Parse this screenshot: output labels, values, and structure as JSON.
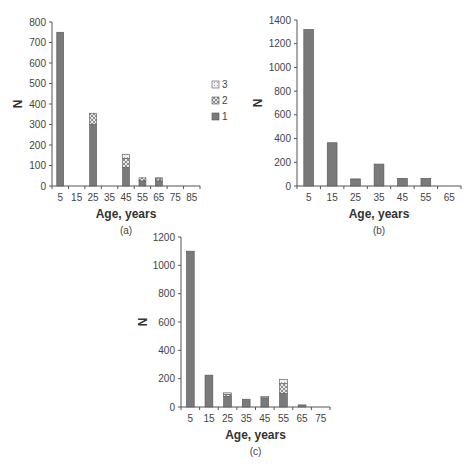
{
  "colors": {
    "series_1": "#7a7a7a",
    "series_2_pattern": "#9a9a9a",
    "series_3": "#e6e6e6",
    "axis": "#555555"
  },
  "chart_data": [
    {
      "id": "a",
      "type": "bar",
      "stacked": true,
      "caption": "(a)",
      "title": "",
      "xlabel": "Age, years",
      "ylabel": "N",
      "categories": [
        "5",
        "15",
        "25",
        "35",
        "45",
        "55",
        "65",
        "75",
        "85"
      ],
      "yticks": [
        0,
        100,
        200,
        300,
        400,
        500,
        600,
        700,
        800
      ],
      "ylim": [
        0,
        800
      ],
      "legend": {
        "position": "right",
        "entries": [
          "3",
          "2",
          "1"
        ]
      },
      "series": [
        {
          "name": "1",
          "values": [
            750,
            0,
            300,
            0,
            90,
            25,
            25,
            0,
            0
          ]
        },
        {
          "name": "2",
          "values": [
            0,
            0,
            55,
            0,
            45,
            15,
            10,
            0,
            0
          ]
        },
        {
          "name": "3",
          "values": [
            0,
            0,
            0,
            0,
            20,
            0,
            5,
            0,
            0
          ]
        }
      ],
      "grid": false
    },
    {
      "id": "b",
      "type": "bar",
      "stacked": false,
      "caption": "(b)",
      "title": "",
      "xlabel": "Age, years",
      "ylabel": "N",
      "categories": [
        "5",
        "15",
        "25",
        "35",
        "45",
        "55",
        "65"
      ],
      "yticks": [
        0,
        200,
        400,
        600,
        800,
        1000,
        1200,
        1400
      ],
      "ylim": [
        0,
        1400
      ],
      "series": [
        {
          "name": "1",
          "values": [
            1320,
            365,
            60,
            185,
            65,
            65,
            0
          ]
        }
      ],
      "grid": false
    },
    {
      "id": "c",
      "type": "bar",
      "stacked": true,
      "caption": "(c)",
      "title": "",
      "xlabel": "Age, years",
      "ylabel": "N",
      "categories": [
        "5",
        "15",
        "25",
        "35",
        "45",
        "55",
        "65",
        "75"
      ],
      "yticks": [
        0,
        200,
        400,
        600,
        800,
        1000,
        1200
      ],
      "ylim": [
        0,
        1200
      ],
      "series": [
        {
          "name": "1",
          "values": [
            1100,
            225,
            75,
            55,
            65,
            95,
            15,
            0
          ]
        },
        {
          "name": "2",
          "values": [
            0,
            0,
            15,
            0,
            0,
            70,
            0,
            0
          ]
        },
        {
          "name": "3",
          "values": [
            0,
            0,
            10,
            0,
            10,
            30,
            0,
            0
          ]
        }
      ],
      "grid": false
    }
  ]
}
